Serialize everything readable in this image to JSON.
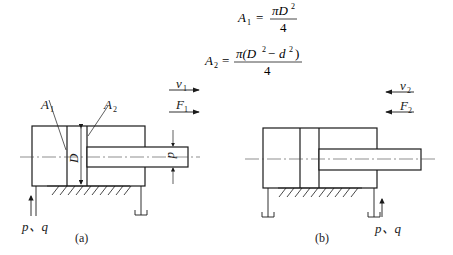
{
  "formulas": {
    "a1": {
      "lhs": "A",
      "lhs_sub": "1",
      "eq": "=",
      "num": "πD",
      "num_sup": "2",
      "den": "4"
    },
    "a2": {
      "lhs": "A",
      "lhs_sub": "2",
      "eq": "=",
      "num_pre": "π(D",
      "num_sup1": "2",
      "num_mid": " − d",
      "num_sup2": "2",
      "num_post": ")",
      "den": "4"
    }
  },
  "figure_a": {
    "caption": "(a)",
    "label_A1": "A",
    "label_A1_sub": "1",
    "label_A2": "A",
    "label_A2_sub": "2",
    "label_D": "D",
    "label_d": "d",
    "label_v": "v",
    "label_v_sub": "1",
    "v_direction": "right",
    "label_F": "F",
    "label_F_sub": "1",
    "F_direction": "right",
    "inlet": "p、q"
  },
  "figure_b": {
    "caption": "(b)",
    "label_v": "v",
    "label_v_sub": "2",
    "v_direction": "left",
    "label_F": "F",
    "label_F_sub": "2",
    "F_direction": "left",
    "inlet": "p、q"
  },
  "colors": {
    "stroke": "#1a1a1a",
    "centerline": "#444444"
  }
}
